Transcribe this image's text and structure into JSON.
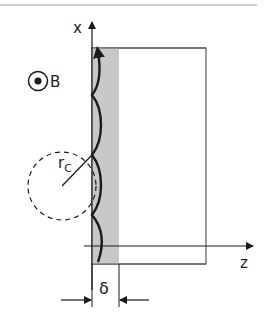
{
  "diagram": {
    "axis_x_label": "x",
    "axis_z_label": "z",
    "field_label": "B",
    "radius_label_main": "r",
    "radius_label_sub": "C",
    "thickness_label": "δ"
  },
  "colors": {
    "line": "#1a1a1a",
    "rect_border": "#555555",
    "band_fill": "#c8c8c8",
    "top_rule": "#999999"
  }
}
